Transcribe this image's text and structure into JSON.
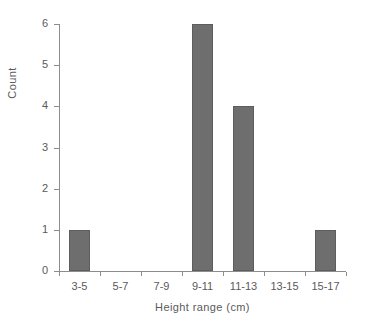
{
  "chart_data": {
    "type": "bar",
    "title": "",
    "subtitle": "",
    "xlabel": "Height range (cm)",
    "ylabel": "Count",
    "categories": [
      "3-5",
      "5-7",
      "7-9",
      "9-11",
      "11-13",
      "13-15",
      "15-17"
    ],
    "values": [
      1,
      0,
      0,
      6,
      4,
      0,
      1
    ],
    "ylim": [
      0,
      6
    ],
    "ytick_labels": [
      "0",
      "1",
      "2",
      "3",
      "4",
      "5",
      "6"
    ],
    "ytick_values": [
      0,
      1,
      2,
      3,
      4,
      5,
      6
    ],
    "grid": false,
    "legend": false,
    "legend_position": "none",
    "bar_color": "#6e6e6e",
    "bar_edge_color": "#5d5d5d",
    "axis_color": "#8d8d8d",
    "text_color": "#5a5a5a",
    "background_color": "#ffffff"
  }
}
